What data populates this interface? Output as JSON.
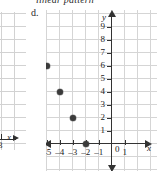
{
  "heading": {
    "clipped_text": "linear pattern"
  },
  "left_figure": {
    "tick_label": "3",
    "axis_label": "x"
  },
  "main_figure": {
    "letter": "d.",
    "origin_label": "0",
    "x_axis_label": "x",
    "y_axis_label": "y",
    "x_ticks": [
      "-6",
      "-5",
      "-4",
      "-3",
      "-2",
      "-1",
      "1"
    ],
    "y_ticks": [
      "9",
      "8",
      "7",
      "6",
      "5",
      "4",
      "3",
      "2",
      "1"
    ]
  },
  "chart_data": {
    "type": "scatter",
    "title": "",
    "xlabel": "x",
    "ylabel": "y",
    "xlim": [
      -7,
      2
    ],
    "ylim": [
      -1,
      10
    ],
    "grid": true,
    "legend": "none",
    "x": [
      -6,
      -5,
      -4,
      -3,
      -2
    ],
    "y": [
      8,
      6,
      4,
      2,
      0
    ],
    "points": [
      {
        "x": -6,
        "y": 8
      },
      {
        "x": -5,
        "y": 6
      },
      {
        "x": -4,
        "y": 4
      },
      {
        "x": -3,
        "y": 2
      },
      {
        "x": -2,
        "y": 0
      }
    ],
    "xtick_labels": [
      "-6",
      "-5",
      "-4",
      "-3",
      "-2",
      "-1",
      "0",
      "1"
    ],
    "ytick_labels": [
      "1",
      "2",
      "3",
      "4",
      "5",
      "6",
      "7",
      "8",
      "9"
    ],
    "marker_color": "#3b3b3b"
  }
}
